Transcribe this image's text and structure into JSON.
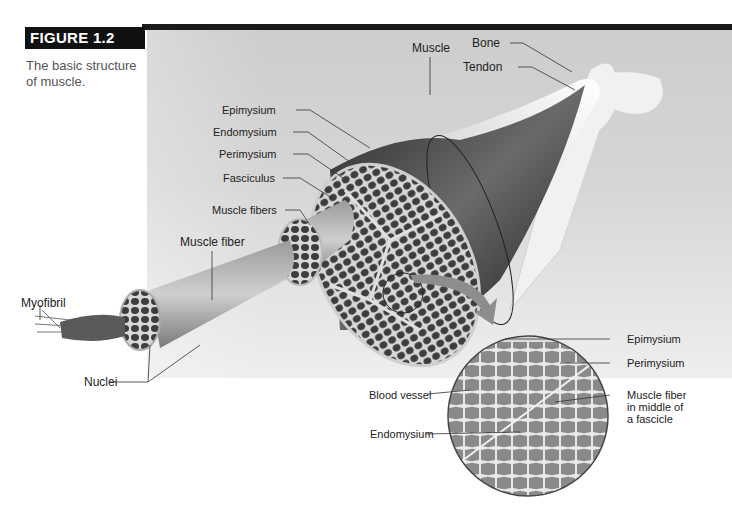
{
  "figure": {
    "number_label": "FIGURE 1.2",
    "caption_line1": "The basic structure",
    "caption_line2": "of muscle."
  },
  "labels": {
    "bone": "Bone",
    "tendon": "Tendon",
    "muscle": "Muscle",
    "epimysium": "Epimysium",
    "endomysium": "Endomysium",
    "perimysium": "Perimysium",
    "fasciculus": "Fasciculus",
    "muscle_fibers": "Muscle fibers",
    "muscle_fiber": "Muscle fiber",
    "myofibril": "Myofibril",
    "nuclei": "Nuclei"
  },
  "micrograph_labels": {
    "epimysium": "Epimysium",
    "perimysium": "Perimysium",
    "muscle_fiber_line1": "Muscle fiber",
    "muscle_fiber_line2": "in middle of",
    "muscle_fiber_line3": "a fascicle",
    "blood_vessel": "Blood vessel",
    "endomysium": "Endomysium"
  },
  "colors": {
    "header_bar": "#111111",
    "panel_gray": "#d4d4d4",
    "tissue_dark": "#3a3a3a",
    "bone_white": "#f2f2f2"
  }
}
